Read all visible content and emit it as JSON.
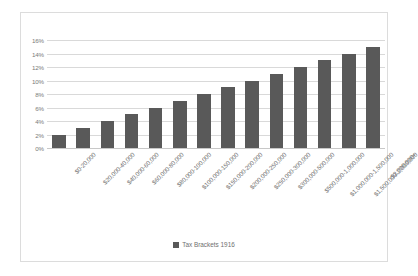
{
  "chart_data": {
    "type": "bar",
    "title": "",
    "xlabel": "",
    "ylabel": "",
    "ylim": [
      0,
      16
    ],
    "ytick_labels": [
      "16%",
      "14%",
      "12%",
      "10%",
      "8%",
      "6%",
      "4%",
      "2%",
      "0%"
    ],
    "ytick_values": [
      16,
      14,
      12,
      10,
      8,
      6,
      4,
      2,
      0
    ],
    "grid": true,
    "legend_position": "bottom",
    "series": [
      {
        "name": "Tax Brackets 1916",
        "color": "#595959",
        "values": [
          2,
          3,
          4,
          5,
          6,
          7,
          8,
          9,
          10,
          11,
          12,
          13,
          14,
          15
        ]
      }
    ],
    "categories": [
      "$0-20,000",
      "$20,000-40,000",
      "$40,000-60,000",
      "$60,000-80,000",
      "$80,000-100,000",
      "$100,000-150,000",
      "$150,000-200,000",
      "$200,000-250,000",
      "$250,000-300,000",
      "$300,000-500,000",
      "$500,000-1,000,000",
      "$1,000,000-1,500,000",
      "$1,500,000-2,000,000",
      "$2,000,000+"
    ]
  },
  "legend": {
    "label": "Tax Brackets 1916"
  },
  "colors": {
    "bar": "#595959",
    "gridline": "#d9d9d9",
    "border": "#dcdcdc",
    "text": "#6f6f6f",
    "background": "#ffffff"
  }
}
